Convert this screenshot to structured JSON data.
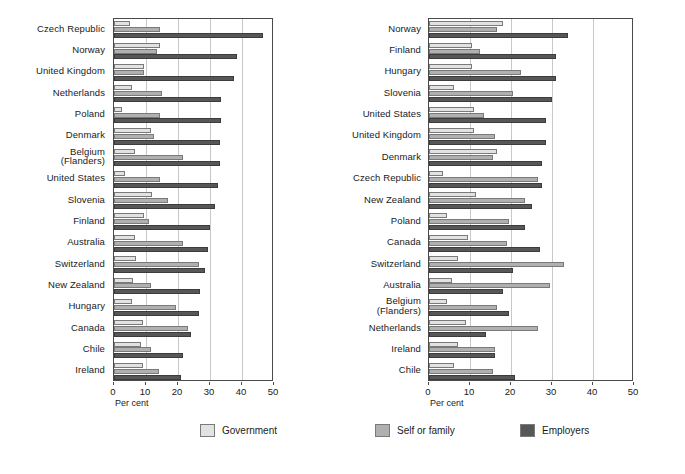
{
  "chart_data": [
    {
      "id": "left",
      "type": "bar",
      "orientation": "horizontal",
      "title": "",
      "xlabel": "Per cent",
      "ylabel": "",
      "xlim": [
        0,
        50
      ],
      "xticks": [
        0,
        10,
        20,
        30,
        40,
        50
      ],
      "xticklabels": [
        "0",
        "10",
        "20",
        "30",
        "40",
        "50"
      ],
      "grid": true,
      "grid_axis": "x",
      "legend_position": "bottom",
      "categories": [
        "Czech Republic",
        "Norway",
        "United Kingdom",
        "Netherlands",
        "Poland",
        "Denmark",
        "Belgium (Flanders)",
        "United States",
        "Slovenia",
        "Finland",
        "Australia",
        "Switzerland",
        "New Zealand",
        "Hungary",
        "Canada",
        "Chile",
        "Ireland"
      ],
      "series": [
        {
          "name": "Government",
          "values": [
            5.0,
            14.5,
            9.5,
            5.5,
            2.5,
            11.5,
            6.5,
            3.5,
            12.0,
            9.5,
            6.5,
            7.0,
            6.0,
            5.5,
            9.0,
            8.5,
            9.0
          ]
        },
        {
          "name": "Self or family",
          "values": [
            14.5,
            13.5,
            9.5,
            15.0,
            14.5,
            12.5,
            21.5,
            14.5,
            17.0,
            11.0,
            21.5,
            26.5,
            11.5,
            19.5,
            23.0,
            11.5,
            14.0
          ]
        },
        {
          "name": "Employers",
          "values": [
            46.5,
            38.5,
            37.5,
            33.5,
            33.5,
            33.0,
            33.0,
            32.5,
            31.5,
            30.0,
            29.5,
            28.5,
            27.0,
            26.5,
            24.0,
            21.5,
            21.0
          ]
        }
      ]
    },
    {
      "id": "right",
      "type": "bar",
      "orientation": "horizontal",
      "title": "",
      "xlabel": "Per cent",
      "ylabel": "",
      "xlim": [
        0,
        50
      ],
      "xticks": [
        0,
        10,
        20,
        30,
        40,
        50
      ],
      "xticklabels": [
        "0",
        "10",
        "20",
        "30",
        "40",
        "50"
      ],
      "grid": true,
      "grid_axis": "x",
      "legend_position": "bottom",
      "categories": [
        "Norway",
        "Finland",
        "Hungary",
        "Slovenia",
        "United States",
        "United Kingdom",
        "Denmark",
        "Czech Republic",
        "New Zealand",
        "Poland",
        "Canada",
        "Switzerland",
        "Australia",
        "Belgium (Flanders)",
        "Netherlands",
        "Ireland",
        "Chile"
      ],
      "series": [
        {
          "name": "Government",
          "values": [
            18.0,
            10.5,
            10.5,
            6.0,
            11.0,
            11.0,
            16.5,
            3.5,
            11.5,
            4.5,
            9.5,
            7.0,
            5.5,
            4.5,
            9.0,
            7.0,
            6.0
          ]
        },
        {
          "name": "Self or family",
          "values": [
            16.5,
            12.5,
            22.5,
            20.5,
            13.5,
            16.0,
            15.5,
            26.5,
            23.5,
            19.5,
            19.0,
            33.0,
            29.5,
            16.5,
            26.5,
            16.0,
            15.5
          ]
        },
        {
          "name": "Employers",
          "values": [
            34.0,
            31.0,
            31.0,
            30.0,
            28.5,
            28.5,
            27.5,
            27.5,
            25.0,
            23.5,
            27.0,
            20.5,
            18.0,
            19.5,
            14.0,
            16.0,
            21.0
          ]
        }
      ]
    }
  ],
  "legend": {
    "items": [
      {
        "label": "Government",
        "color": "#e2e2e2"
      },
      {
        "label": "Self or family",
        "color": "#b0b0b0"
      },
      {
        "label": "Employers",
        "color": "#575757"
      }
    ]
  },
  "axis": {
    "xlabel": "Per cent"
  }
}
